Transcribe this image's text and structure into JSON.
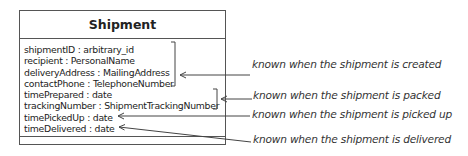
{
  "class": {
    "name": "Shipment",
    "attributes": [
      "shipmentID : arbitrary_id",
      "recipient : PersonalName",
      "deliveryAddress : MailingAddress",
      "contactPhone : TelephoneNumber",
      "timePrepared : date",
      "trackingNumber : ShipmentTrackingNumber",
      "timePickedUp : date",
      "timeDelivered : date"
    ],
    "operations": []
  },
  "annotations": [
    {
      "text": "known when the shipment is created",
      "targets": [
        "shipmentID",
        "recipient",
        "deliveryAddress",
        "contactPhone"
      ]
    },
    {
      "text": "known when the shipment is packed",
      "targets": [
        "timePrepared",
        "trackingNumber"
      ]
    },
    {
      "text": "known when the shipment is picked up",
      "targets": [
        "timePickedUp"
      ]
    },
    {
      "text": "known when the shipment is delivered",
      "targets": [
        "timeDelivered"
      ]
    }
  ],
  "colors": {
    "line": "#555555",
    "text": "#222222",
    "background": "#ffffff"
  }
}
